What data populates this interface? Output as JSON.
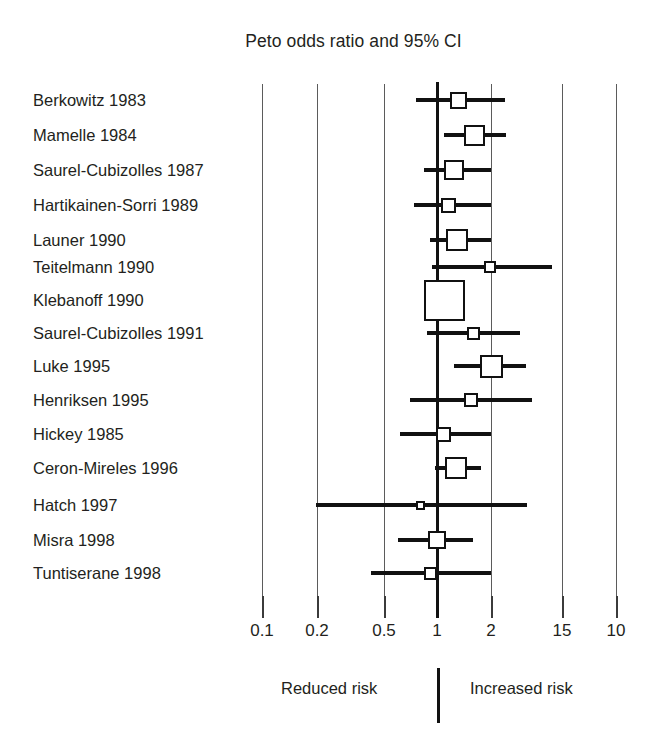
{
  "chart_data": {
    "type": "scatter",
    "subtype": "forest-plot",
    "title": "Peto odds ratio and 95% CI",
    "xlabel": "",
    "ylabel": "",
    "xscale": "log",
    "grid": true,
    "legend": false,
    "null_value": 1,
    "axis_ticks": [
      "0.1",
      "0.2",
      "0.5",
      "1",
      "2",
      "15",
      "10"
    ],
    "axis_tick_positions_px": [
      262,
      317,
      384,
      437,
      491,
      562,
      616
    ],
    "direction_labels": {
      "left": "Reduced risk",
      "right": "Increased risk"
    },
    "categories": [
      "Berkowitz 1983",
      "Mamelle 1984",
      "Saurel-Cubizolles 1987",
      "Hartikainen-Sorri 1989",
      "Launer 1990",
      "Teitelmann 1990",
      "Klebanoff 1990",
      "Saurel-Cubizolles 1991",
      "Luke 1995",
      "Henriksen 1995",
      "Hickey 1985",
      "Ceron-Mireles 1996",
      "Hatch 1997",
      "Misra 1998",
      "Tuntiserane 1998"
    ],
    "studies": [
      {
        "label": "Berkowitz 1983",
        "row": 1,
        "y": 100,
        "est_px": 458,
        "lo_px": 416,
        "hi_px": 505,
        "box_px": 17,
        "est": 1.22,
        "lo": 0.83,
        "hi": 2.15
      },
      {
        "label": "Mamelle 1984",
        "row": 2,
        "y": 135,
        "est_px": 474,
        "lo_px": 444,
        "hi_px": 506,
        "box_px": 21,
        "est": 1.53,
        "lo": 1.06,
        "hi": 2.17
      },
      {
        "label": "Saurel-Cubizolles 1987",
        "row": 3,
        "y": 170,
        "est_px": 454,
        "lo_px": 424,
        "hi_px": 491,
        "box_px": 20,
        "est": 1.16,
        "lo": 0.89,
        "hi": 1.75
      },
      {
        "label": "Hartikainen-Sorri 1989",
        "row": 4,
        "y": 205,
        "est_px": 448,
        "lo_px": 414,
        "hi_px": 491,
        "box_px": 15,
        "est": 1.08,
        "lo": 0.82,
        "hi": 1.75
      },
      {
        "label": "Launer 1990",
        "row": 5,
        "y": 240,
        "est_px": 457,
        "lo_px": 430,
        "hi_px": 491,
        "box_px": 22,
        "est": 1.2,
        "lo": 0.93,
        "hi": 1.75
      },
      {
        "label": "Teitelmann 1990",
        "row": 6,
        "y": 267,
        "est_px": 490,
        "lo_px": 432,
        "hi_px": 552,
        "box_px": 12,
        "est": 2.0,
        "lo": 0.94,
        "hi": 6.2
      },
      {
        "label": "Klebanoff 1990",
        "row": 7,
        "y": 300,
        "est_px": 444,
        "lo_px": 437,
        "hi_px": 450,
        "box_px": 41,
        "est": 1.04,
        "lo": 0.97,
        "hi": 1.12
      },
      {
        "label": "Saurel-Cubizolles 1991",
        "row": 8,
        "y": 333,
        "est_px": 473,
        "lo_px": 427,
        "hi_px": 520,
        "box_px": 13,
        "est": 1.5,
        "lo": 0.9,
        "hi": 2.7
      },
      {
        "label": "Luke 1995",
        "row": 9,
        "y": 366,
        "est_px": 491,
        "lo_px": 454,
        "hi_px": 526,
        "box_px": 23,
        "est": 2.02,
        "lo": 1.2,
        "hi": 2.9
      },
      {
        "label": "Henriksen 1995",
        "row": 10,
        "y": 400,
        "est_px": 471,
        "lo_px": 410,
        "hi_px": 532,
        "box_px": 14,
        "est": 1.45,
        "lo": 0.78,
        "hi": 3.0
      },
      {
        "label": "Hickey 1985",
        "row": 11,
        "y": 434,
        "est_px": 443,
        "lo_px": 400,
        "hi_px": 491,
        "box_px": 15,
        "est": 1.03,
        "lo": 0.72,
        "hi": 1.75
      },
      {
        "label": "Ceron-Mireles 1996",
        "row": 12,
        "y": 468,
        "est_px": 456,
        "lo_px": 435,
        "hi_px": 481,
        "box_px": 22,
        "est": 1.18,
        "lo": 0.99,
        "hi": 1.5
      },
      {
        "label": "Hatch 1997",
        "row": 13,
        "y": 505,
        "est_px": 420,
        "lo_px": 316,
        "hi_px": 527,
        "box_px": 9,
        "est": 0.85,
        "lo": 0.2,
        "hi": 2.8
      },
      {
        "label": "Misra 1998",
        "row": 14,
        "y": 540,
        "est_px": 437,
        "lo_px": 398,
        "hi_px": 473,
        "box_px": 18,
        "est": 1.0,
        "lo": 0.7,
        "hi": 1.45
      },
      {
        "label": "Tuntiserane 1998",
        "row": 15,
        "y": 573,
        "est_px": 430,
        "lo_px": 371,
        "hi_px": 491,
        "box_px": 13,
        "est": 0.92,
        "lo": 0.45,
        "hi": 1.75
      }
    ]
  },
  "colors": {
    "background": "#ffffff",
    "ink": "#111111",
    "text": "#231f20",
    "gridline": "#5b5b5b"
  }
}
